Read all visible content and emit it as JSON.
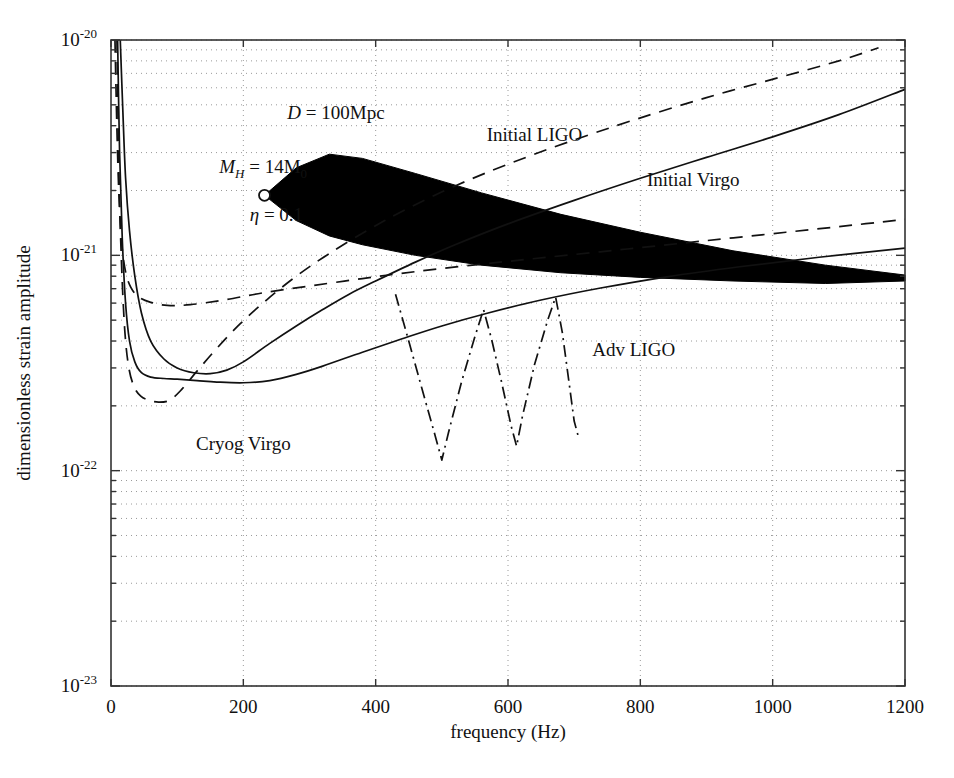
{
  "chart_data": {
    "type": "line",
    "title": "",
    "xlabel": "frequency (Hz)",
    "ylabel": "dimensionless strain amplitude",
    "xlim": [
      0,
      1200
    ],
    "ylim": [
      1e-23,
      1e-20
    ],
    "yscale": "log",
    "xscale": "linear",
    "grid": true,
    "grid_style": "dotted",
    "legend_position": "inline-labels",
    "xticks": [
      0,
      200,
      400,
      600,
      800,
      1000,
      1200
    ],
    "xtick_labels": [
      "0",
      "200",
      "400",
      "600",
      "800",
      "1000",
      "1200"
    ],
    "yticks": [
      1e-20,
      1e-21,
      1e-22,
      1e-23
    ],
    "ytick_labels": [
      "10⁻²⁰",
      "10⁻²¹",
      "10⁻²²",
      "10⁻²³"
    ],
    "ytick_mantissa": "10",
    "ytick_exponents": [
      "-20",
      "-21",
      "-22",
      "-23"
    ],
    "annotations": [
      {
        "name": "distance",
        "text": "D = 100Mpc",
        "symbol": "D",
        "value": "100Mpc",
        "x": 340,
        "y": 4.3e-21
      },
      {
        "name": "halo-mass",
        "text": "M_H = 14M_0",
        "symbol": "M",
        "sub": "H",
        "value": "14M",
        "value_sub": "0",
        "x": 230,
        "y": 2.4e-21
      },
      {
        "name": "eta",
        "text": "η = 0.1",
        "symbol": "η",
        "value": "0.1",
        "x": 250,
        "y": 1.45e-21
      }
    ],
    "marker": {
      "name": "source-start-marker",
      "shape": "open-circle",
      "x": 232,
      "y": 1.9e-21
    },
    "series": [
      {
        "name": "Initial LIGO",
        "label": "Initial LIGO",
        "style": "solid",
        "label_x": 640,
        "label_y": 3.4e-21,
        "points": [
          [
            14,
            1e-20
          ],
          [
            18,
            4.6e-21
          ],
          [
            22,
            2.3e-21
          ],
          [
            28,
            1.3e-21
          ],
          [
            36,
            8e-22
          ],
          [
            46,
            5.4e-22
          ],
          [
            60,
            4e-22
          ],
          [
            80,
            3.3e-22
          ],
          [
            100,
            3e-22
          ],
          [
            125,
            2.85e-22
          ],
          [
            150,
            2.82e-22
          ],
          [
            175,
            2.93e-22
          ],
          [
            200,
            3.2e-22
          ],
          [
            240,
            3.9e-22
          ],
          [
            280,
            4.7e-22
          ],
          [
            320,
            5.6e-22
          ],
          [
            360,
            6.6e-22
          ],
          [
            400,
            7.6e-22
          ],
          [
            460,
            9.3e-22
          ],
          [
            520,
            1.12e-21
          ],
          [
            600,
            1.4e-21
          ],
          [
            700,
            1.8e-21
          ],
          [
            800,
            2.28e-21
          ],
          [
            900,
            2.85e-21
          ],
          [
            1000,
            3.55e-21
          ],
          [
            1100,
            4.5e-21
          ],
          [
            1200,
            5.9e-21
          ]
        ]
      },
      {
        "name": "Initial Virgo",
        "label": "Initial Virgo",
        "style": "dashed",
        "label_x": 880,
        "label_y": 2.1e-21,
        "points": [
          [
            6,
            1e-20
          ],
          [
            9,
            3.8e-21
          ],
          [
            12,
            1.9e-21
          ],
          [
            16,
            1.15e-21
          ],
          [
            22,
            8.4e-22
          ],
          [
            30,
            7.1e-22
          ],
          [
            42,
            6.4e-22
          ],
          [
            60,
            6.05e-22
          ],
          [
            85,
            5.85e-22
          ],
          [
            120,
            5.9e-22
          ],
          [
            170,
            6.2e-22
          ],
          [
            230,
            6.7e-22
          ],
          [
            300,
            7.2e-22
          ],
          [
            380,
            7.8e-22
          ],
          [
            460,
            8.4e-22
          ],
          [
            560,
            9.1e-22
          ],
          [
            660,
            9.8e-22
          ],
          [
            780,
            1.07e-21
          ],
          [
            900,
            1.17e-21
          ],
          [
            1020,
            1.28e-21
          ],
          [
            1120,
            1.38e-21
          ],
          [
            1200,
            1.47e-21
          ]
        ]
      },
      {
        "name": "Adv LIGO",
        "label": "Adv LIGO",
        "style": "solid",
        "label_x": 790,
        "label_y": 3.4e-22,
        "points": [
          [
            10,
            1e-20
          ],
          [
            13,
            3e-21
          ],
          [
            17,
            1.2e-21
          ],
          [
            22,
            6e-22
          ],
          [
            28,
            4e-22
          ],
          [
            36,
            3.2e-22
          ],
          [
            46,
            2.85e-22
          ],
          [
            60,
            2.72e-22
          ],
          [
            80,
            2.68e-22
          ],
          [
            100,
            2.66e-22
          ],
          [
            130,
            2.62e-22
          ],
          [
            160,
            2.58e-22
          ],
          [
            200,
            2.56e-22
          ],
          [
            240,
            2.62e-22
          ],
          [
            280,
            2.8e-22
          ],
          [
            320,
            3.06e-22
          ],
          [
            380,
            3.55e-22
          ],
          [
            440,
            4.1e-22
          ],
          [
            500,
            4.7e-22
          ],
          [
            570,
            5.4e-22
          ],
          [
            650,
            6.2e-22
          ],
          [
            740,
            7.05e-22
          ],
          [
            840,
            7.95e-22
          ],
          [
            950,
            8.85e-22
          ],
          [
            1070,
            9.8e-22
          ],
          [
            1200,
            1.08e-21
          ]
        ]
      },
      {
        "name": "Cryog Virgo",
        "label": "Cryog Virgo",
        "style": "dashed",
        "label_x": 200,
        "label_y": 1.25e-22,
        "points": [
          [
            9,
            1e-20
          ],
          [
            12,
            2.4e-21
          ],
          [
            16,
            9e-22
          ],
          [
            21,
            4.4e-22
          ],
          [
            27,
            3e-22
          ],
          [
            35,
            2.45e-22
          ],
          [
            45,
            2.22e-22
          ],
          [
            58,
            2.12e-22
          ],
          [
            72,
            2.08e-22
          ],
          [
            88,
            2.12e-22
          ],
          [
            105,
            2.35e-22
          ],
          [
            130,
            2.9e-22
          ],
          [
            160,
            3.7e-22
          ],
          [
            195,
            4.8e-22
          ],
          [
            235,
            6.2e-22
          ],
          [
            280,
            8e-22
          ],
          [
            330,
            1.02e-21
          ],
          [
            390,
            1.32e-21
          ],
          [
            450,
            1.66e-21
          ],
          [
            520,
            2.1e-21
          ],
          [
            600,
            2.65e-21
          ],
          [
            690,
            3.35e-21
          ],
          [
            790,
            4.25e-21
          ],
          [
            900,
            5.4e-21
          ],
          [
            1010,
            6.7e-21
          ],
          [
            1100,
            8e-21
          ],
          [
            1160,
            9.2e-21
          ]
        ]
      },
      {
        "name": "resonant bars",
        "label": "",
        "style": "dash-dot",
        "label_x": null,
        "label_y": null,
        "points": [
          [
            430,
            6.6e-22
          ],
          [
            450,
            4e-22
          ],
          [
            470,
            2.4e-22
          ],
          [
            490,
            1.45e-22
          ],
          [
            500,
            1.12e-22
          ],
          [
            510,
            1.5e-22
          ],
          [
            530,
            2.6e-22
          ],
          [
            550,
            4.2e-22
          ],
          [
            563,
            5.6e-22
          ],
          [
            575,
            4.1e-22
          ],
          [
            590,
            2.6e-22
          ],
          [
            605,
            1.6e-22
          ],
          [
            613,
            1.3e-22
          ],
          [
            622,
            1.8e-22
          ],
          [
            640,
            3.1e-22
          ],
          [
            660,
            5e-22
          ],
          [
            672,
            6.4e-22
          ],
          [
            682,
            4.4e-22
          ],
          [
            692,
            2.6e-22
          ],
          [
            700,
            1.7e-22
          ],
          [
            706,
            1.45e-22
          ]
        ]
      }
    ],
    "filled_region": {
      "name": "chirp-signal-wedge",
      "description": "black filled wedge, inspiral signal amplitude band",
      "color": "#000000",
      "upper": [
        [
          232,
          1.9e-21
        ],
        [
          280,
          2.55e-21
        ],
        [
          330,
          2.95e-21
        ],
        [
          380,
          2.82e-21
        ],
        [
          460,
          2.4e-21
        ],
        [
          560,
          1.95e-21
        ],
        [
          680,
          1.55e-21
        ],
        [
          800,
          1.28e-21
        ],
        [
          940,
          1.05e-21
        ],
        [
          1080,
          9e-22
        ],
        [
          1200,
          8.1e-22
        ]
      ],
      "lower": [
        [
          1200,
          7.6e-22
        ],
        [
          1080,
          7.4e-22
        ],
        [
          940,
          7.6e-22
        ],
        [
          800,
          7.9e-22
        ],
        [
          680,
          8.3e-22
        ],
        [
          560,
          9e-22
        ],
        [
          460,
          1e-21
        ],
        [
          380,
          1.12e-21
        ],
        [
          330,
          1.23e-21
        ],
        [
          280,
          1.45e-21
        ],
        [
          232,
          1.9e-21
        ]
      ]
    }
  }
}
